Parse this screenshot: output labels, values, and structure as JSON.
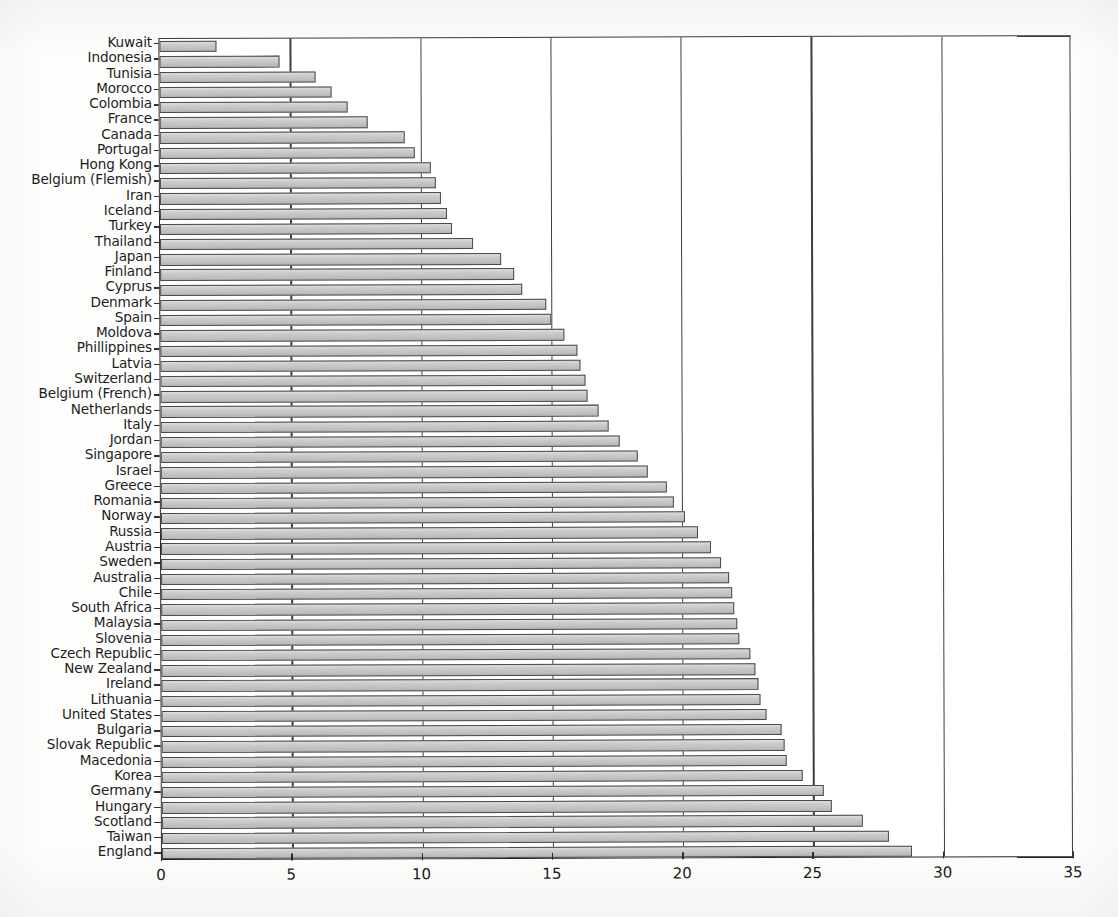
{
  "chart_data": {
    "type": "bar",
    "orientation": "horizontal",
    "title": "",
    "subtitle": "",
    "xlabel": "",
    "ylabel": "",
    "xlim": [
      0,
      35
    ],
    "ylim": null,
    "grid": true,
    "legend": null,
    "legend_position": "none",
    "xticks": [
      0,
      5,
      10,
      15,
      20,
      25,
      30,
      35
    ],
    "xtick_labels": [
      "0",
      "5",
      "10",
      "15",
      "20",
      "25",
      "30",
      "35"
    ],
    "bar_color": "#c9c9c9",
    "bar_edge_color": "#4a4a4a",
    "axis_color": "#2a2a2a",
    "categories": [
      "Kuwait",
      "Indonesia",
      "Tunisia",
      "Morocco",
      "Colombia",
      "France",
      "Canada",
      "Portugal",
      "Hong Kong",
      "Belgium (Flemish)",
      "Iran",
      "Iceland",
      "Turkey",
      "Thailand",
      "Japan",
      "Finland",
      "Cyprus",
      "Denmark",
      "Spain",
      "Moldova",
      "Phillippines",
      "Latvia",
      "Switzerland",
      "Belgium (French)",
      "Netherlands",
      "Italy",
      "Jordan",
      "Singapore",
      "Israel",
      "Greece",
      "Romania",
      "Norway",
      "Russia",
      "Austria",
      "Sweden",
      "Australia",
      "Chile",
      "South Africa",
      "Malaysia",
      "Slovenia",
      "Czech Republic",
      "New Zealand",
      "Ireland",
      "Lithuania",
      "United States",
      "Bulgaria",
      "Slovak Republic",
      "Macedonia",
      "Korea",
      "Germany",
      "Hungary",
      "Scotland",
      "Taiwan",
      "England"
    ],
    "values": [
      2.2,
      4.6,
      6.0,
      6.6,
      7.2,
      8.0,
      9.4,
      9.8,
      10.4,
      10.6,
      10.8,
      11.0,
      11.2,
      12.0,
      13.1,
      13.6,
      13.9,
      14.8,
      15.0,
      15.5,
      16.0,
      16.1,
      16.3,
      16.4,
      16.8,
      17.2,
      17.6,
      18.3,
      18.7,
      19.4,
      19.7,
      20.1,
      20.6,
      21.1,
      21.5,
      21.8,
      21.9,
      22.0,
      22.1,
      22.2,
      22.6,
      22.8,
      22.9,
      23.0,
      23.2,
      23.8,
      23.9,
      24.0,
      24.6,
      25.4,
      25.7,
      26.9,
      27.9,
      28.8
    ]
  }
}
